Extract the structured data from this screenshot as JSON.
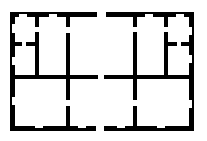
{
  "diagram": {
    "type": "floor-plan",
    "wall_color": "#000000",
    "background_color": "#ffffff",
    "outer_bounds": {
      "x": 10,
      "y": 12,
      "width": 184,
      "height": 119
    },
    "rooms": [
      {
        "id": "room-top-left-upper",
        "label": ""
      },
      {
        "id": "room-top-left-lower",
        "label": ""
      },
      {
        "id": "room-top-left-center",
        "label": ""
      },
      {
        "id": "room-top-center",
        "label": ""
      },
      {
        "id": "room-top-right-center",
        "label": ""
      },
      {
        "id": "room-top-right-upper",
        "label": ""
      },
      {
        "id": "room-top-right-lower",
        "label": ""
      },
      {
        "id": "room-bottom-left",
        "label": ""
      },
      {
        "id": "room-bottom-center",
        "label": ""
      },
      {
        "id": "room-bottom-right",
        "label": ""
      }
    ],
    "openings": [
      {
        "name": "top-entrance",
        "x": 97,
        "width": 9
      },
      {
        "name": "middle-passage",
        "x": 98,
        "width": 6
      },
      {
        "name": "bottom-entrance",
        "x": 96,
        "width": 8
      }
    ]
  }
}
